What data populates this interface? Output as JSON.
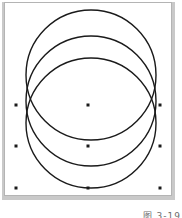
{
  "figure": {
    "caption": "图 3-19",
    "frame": {
      "border_color": "#b4b4b4",
      "shadow_color": "#c9c9c9",
      "background": "#ffffff"
    }
  },
  "drawing": {
    "stroke_color": "#1a1a1a",
    "fill": "none",
    "stroke_width": 1.4,
    "description": "three overlapping circles",
    "shapes": [
      {
        "name": "circle-top",
        "type": "circle",
        "cx": 91,
        "cy": 75,
        "r": 65
      },
      {
        "name": "circle-middle",
        "type": "circle",
        "cx": 91,
        "cy": 101,
        "r": 65
      },
      {
        "name": "circle-bottom",
        "type": "circle",
        "cx": 91,
        "cy": 123,
        "r": 65
      }
    ]
  },
  "selection": {
    "handle_color": "#1a1a1a",
    "handle_size": 3,
    "bounds": {
      "x": 16,
      "y": 105,
      "width": 146,
      "height": 83
    },
    "handles": [
      {
        "name": "handle-top-left",
        "x": 16,
        "y": 105
      },
      {
        "name": "handle-top-center",
        "x": 88,
        "y": 105
      },
      {
        "name": "handle-top-right",
        "x": 160,
        "y": 105
      },
      {
        "name": "handle-middle-left",
        "x": 16,
        "y": 146
      },
      {
        "name": "handle-middle-center",
        "x": 88,
        "y": 146
      },
      {
        "name": "handle-middle-right",
        "x": 160,
        "y": 146
      },
      {
        "name": "handle-bottom-left",
        "x": 16,
        "y": 188
      },
      {
        "name": "handle-bottom-center",
        "x": 88,
        "y": 188
      },
      {
        "name": "handle-bottom-right",
        "x": 160,
        "y": 188
      }
    ]
  }
}
